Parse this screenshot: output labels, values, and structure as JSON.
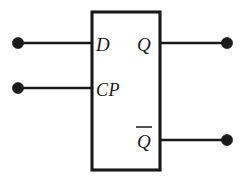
{
  "diagram": {
    "kind": "d-flip-flop-logic-symbol",
    "background_color": "#ffffff",
    "line_color": "#1a1a1a",
    "body": {
      "x": 92,
      "y": 12,
      "width": 68,
      "height": 158
    },
    "inputs": [
      {
        "id": "d-input",
        "label": "D",
        "overline": false,
        "label_x": 96,
        "label_y": 51,
        "wire_y": 43,
        "wire_x_start": 18,
        "wire_x_end": 92,
        "terminal_x": 18,
        "terminal_r": 5.6
      },
      {
        "id": "cp-input",
        "label": "CP",
        "overline": false,
        "label_x": 96,
        "label_y": 96,
        "wire_y": 88,
        "wire_x_start": 18,
        "wire_x_end": 92,
        "terminal_x": 18,
        "terminal_r": 5.6
      }
    ],
    "outputs": [
      {
        "id": "q-output",
        "label": "Q",
        "overline": false,
        "label_x": 137,
        "label_y": 51,
        "wire_y": 43,
        "wire_x_start": 160,
        "wire_x_end": 227,
        "terminal_x": 227,
        "terminal_r": 5.6,
        "bar_x1": 0,
        "bar_x2": 0,
        "bar_y": 0
      },
      {
        "id": "q-not-output",
        "label": "Q",
        "overline": true,
        "label_x": 137,
        "label_y": 148,
        "wire_y": 140,
        "wire_x_start": 160,
        "wire_x_end": 227,
        "terminal_x": 227,
        "terminal_r": 5.6,
        "bar_x1": 136,
        "bar_x2": 152,
        "bar_y": 127
      }
    ]
  }
}
